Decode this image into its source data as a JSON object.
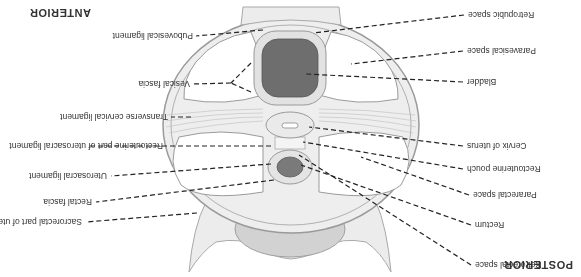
{
  "orientation": {
    "top": "POSTERIOR",
    "bottom": "ANTERIOR"
  },
  "labels_left": [
    {
      "id": "retrorectal",
      "text": "Retrorectal space"
    },
    {
      "id": "rectum",
      "text": "Rectum"
    },
    {
      "id": "pararectal",
      "text": "Pararectal space"
    },
    {
      "id": "rectouterine-pouch",
      "text": "Rectouterine pouch"
    },
    {
      "id": "cervix",
      "text": "Cervix of uterus"
    },
    {
      "id": "bladder",
      "text": "Bladder"
    },
    {
      "id": "paravesical",
      "text": "Paravesical space"
    },
    {
      "id": "retropubic",
      "text": "Retropubic space"
    }
  ],
  "labels_right": [
    {
      "id": "sacrorectal",
      "text": "Sacrorectal part of uterosacral ligament"
    },
    {
      "id": "rectal-fascia",
      "text": "Rectal fascia"
    },
    {
      "id": "uterosacral",
      "text": "Uterosacral ligament"
    },
    {
      "id": "rectouterine-part",
      "text": "Rectouterine part of uterosacral ligament"
    },
    {
      "id": "transverse-cervical",
      "text": "Transverse cervical ligament"
    },
    {
      "id": "vesical-fascia",
      "text": "Vesical fascia"
    },
    {
      "id": "pubovesical",
      "text": "Pubovesical ligament"
    }
  ],
  "colors": {
    "tissue": "#e6e6e6",
    "tissue_stroke": "#9a9a9a",
    "bladder": "#6e6e6e",
    "rectum": "#7a7a7a",
    "sacrum": "#cfcfcf",
    "leader": "#222222"
  }
}
